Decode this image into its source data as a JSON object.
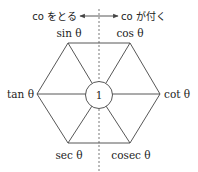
{
  "diagram": {
    "type": "hexagon-mnemonic",
    "center_label": "1",
    "vertices": {
      "top_left": "sin θ",
      "top_right": "cos θ",
      "left": "tan θ",
      "right": "cot θ",
      "bottom_left": "sec θ",
      "bottom_right": "cosec θ"
    },
    "arrow": {
      "left_text": "co をとる",
      "right_text": "co が付く"
    },
    "colors": {
      "line": "#444444",
      "text": "#222222",
      "background": "#ffffff"
    }
  }
}
